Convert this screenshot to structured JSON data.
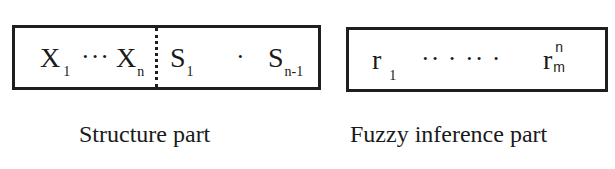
{
  "diagram": {
    "structure_part": {
      "label": "Structure part",
      "first_symbol": {
        "base": "X",
        "sub": "1"
      },
      "first_ellipsis": "···",
      "last_input_symbol": {
        "base": "X",
        "sub": "n"
      },
      "divider": "dotted",
      "s_first": {
        "base": "S",
        "sub": "1"
      },
      "s_middle_dot": "·",
      "s_last": {
        "base": "S",
        "sub": "n-1"
      }
    },
    "fuzzy_inference_part": {
      "label": "Fuzzy inference part",
      "first_symbol": {
        "base": "r",
        "sub": "1"
      },
      "ellipsis": "·· · ·· ·",
      "last_symbol": {
        "base": "r",
        "sub": "m",
        "sup": "n"
      }
    },
    "colors": {
      "stroke": "#1e1e1e",
      "text": "#1a1a1a",
      "background": "#ffffff"
    }
  }
}
